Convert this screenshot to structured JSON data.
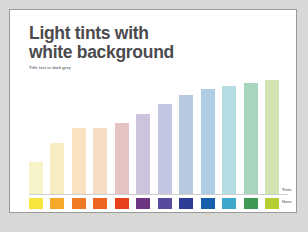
{
  "slide": {
    "title": "Light tints with\nwhite background",
    "subtitle": "Title text in dark grey",
    "background_color": "#ffffff",
    "border_color": "#9a9a9a",
    "page_background_color": "#d8d8d6",
    "title_color": "#4b4b4d",
    "subtitle_color": "#6f6f72"
  },
  "legend": {
    "tints_label": "Tints",
    "hues_label": "Hues"
  },
  "chart_data": {
    "type": "bar",
    "title": "Light tints with white background",
    "subtitle": "Title text in dark grey",
    "xlabel": "",
    "ylabel": "",
    "ylim": [
      0,
      100
    ],
    "grid": false,
    "legend_position": "right",
    "legend_entries": [
      "Tints",
      "Hues"
    ],
    "categories": [
      "1",
      "2",
      "3",
      "4",
      "5",
      "6",
      "7",
      "8",
      "9",
      "10",
      "11",
      "12"
    ],
    "values": [
      28,
      45,
      58,
      58,
      62,
      70,
      79,
      87,
      92,
      95,
      97,
      100
    ],
    "series": [
      {
        "name": "Tints",
        "values": [
          28,
          45,
          58,
          58,
          62,
          70,
          79,
          87,
          92,
          95,
          97,
          100
        ],
        "colors": [
          "#f7f3c8",
          "#f7edc0",
          "#f8e2c0",
          "#f6ddc6",
          "#e8c3c4",
          "#cec3dd",
          "#c3c6e2",
          "#b8c8de",
          "#aecfe3",
          "#b4dde3",
          "#a8d5bd",
          "#d2e3b4"
        ]
      },
      {
        "name": "Hues",
        "values": [
          100,
          100,
          100,
          100,
          100,
          100,
          100,
          100,
          100,
          100,
          100,
          100
        ],
        "colors": [
          "#f7e53c",
          "#f5a82a",
          "#ef7c24",
          "#ee6420",
          "#e8401c",
          "#6e3582",
          "#564a9e",
          "#2f3d96",
          "#1460ad",
          "#3ca8cc",
          "#3f9a55",
          "#b4cf34"
        ]
      }
    ]
  }
}
